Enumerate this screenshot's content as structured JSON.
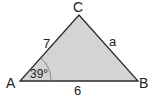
{
  "diagram": {
    "type": "triangle",
    "fill_color": "#d4d4d4",
    "stroke_color": "#2a2a2a",
    "vertices": [
      {
        "label": "A",
        "x": 20,
        "y": 81
      },
      {
        "label": "B",
        "x": 138,
        "y": 81
      },
      {
        "label": "C",
        "x": 79,
        "y": 15
      }
    ],
    "sides": {
      "AC": "7",
      "CB": "a",
      "AB": "6"
    },
    "angle_A": "39°"
  }
}
